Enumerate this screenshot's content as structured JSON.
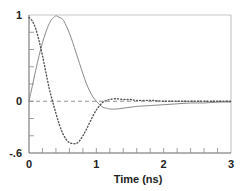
{
  "chart_data": {
    "type": "line",
    "title": "",
    "xlabel": "Time (ns)",
    "ylabel": "",
    "xlim": [
      0,
      3
    ],
    "ylim": [
      -0.6,
      1
    ],
    "grid": false,
    "legend": null,
    "x_ticks": [
      {
        "value": 0,
        "label": "0"
      },
      {
        "value": 1,
        "label": "1"
      },
      {
        "value": 2,
        "label": "2"
      },
      {
        "value": 3,
        "label": "3"
      }
    ],
    "y_ticks": [
      {
        "value": 1,
        "label": "1"
      },
      {
        "value": 0,
        "label": "0"
      },
      {
        "value": -0.6,
        "label": "-.6"
      }
    ],
    "x_minor_tick_step": 0.2,
    "y_minor_tick_step": 0.2,
    "reference_lines": [
      {
        "orientation": "horizontal",
        "value": 0,
        "style": "dashed",
        "color": "#888888"
      }
    ],
    "series": [
      {
        "name": "solid",
        "style": "solid",
        "color": "#888888",
        "x": [
          0,
          0.05,
          0.1,
          0.15,
          0.2,
          0.25,
          0.3,
          0.35,
          0.4,
          0.43,
          0.5,
          0.55,
          0.6,
          0.65,
          0.7,
          0.75,
          0.8,
          0.85,
          0.9,
          0.95,
          1.0,
          1.05,
          1.1,
          1.15,
          1.2,
          1.3,
          1.4,
          1.5,
          1.6,
          1.8,
          2.0,
          2.2,
          2.4,
          2.6,
          2.8,
          3.0
        ],
        "values": [
          0,
          0.18,
          0.36,
          0.53,
          0.68,
          0.8,
          0.9,
          0.96,
          0.99,
          0.98,
          0.95,
          0.88,
          0.79,
          0.68,
          0.56,
          0.44,
          0.32,
          0.21,
          0.12,
          0.05,
          0.0,
          -0.04,
          -0.07,
          -0.08,
          -0.09,
          -0.09,
          -0.08,
          -0.07,
          -0.06,
          -0.05,
          -0.04,
          -0.03,
          -0.02,
          -0.02,
          -0.01,
          -0.01
        ]
      },
      {
        "name": "dotted",
        "style": "dotted",
        "color": "#555555",
        "x": [
          0,
          0.05,
          0.1,
          0.15,
          0.2,
          0.25,
          0.3,
          0.35,
          0.4,
          0.45,
          0.5,
          0.55,
          0.6,
          0.65,
          0.7,
          0.75,
          0.8,
          0.85,
          0.9,
          0.95,
          1.0,
          1.05,
          1.1,
          1.15,
          1.2,
          1.3,
          1.4,
          1.5,
          1.6,
          1.8,
          2.0,
          2.2,
          2.4,
          2.6,
          2.8,
          3.0
        ],
        "values": [
          0.97,
          0.93,
          0.84,
          0.7,
          0.53,
          0.34,
          0.15,
          0.0,
          -0.14,
          -0.27,
          -0.37,
          -0.44,
          -0.48,
          -0.49,
          -0.49,
          -0.46,
          -0.4,
          -0.33,
          -0.25,
          -0.17,
          -0.1,
          -0.05,
          -0.01,
          0.01,
          0.02,
          0.03,
          0.02,
          0.02,
          0.01,
          0.01,
          0.0,
          0.0,
          0.0,
          0.0,
          0.0,
          0.0
        ]
      }
    ]
  },
  "layout": {
    "plot_left": 29,
    "plot_right": 231,
    "plot_top": 15,
    "plot_bottom": 153
  }
}
